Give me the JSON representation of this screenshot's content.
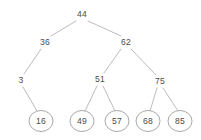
{
  "figure": {
    "width": 201,
    "height": 140,
    "background": "#ffffff",
    "edge_color": "#b4b4b4",
    "node_outline_color": "#9e9e9e",
    "text_color": "#4a4a4a"
  },
  "chart_data": {
    "type": "diagram",
    "diagram_type": "binary-tree",
    "title": "",
    "nodes": [
      {
        "id": "n44",
        "label": "44",
        "x": 82,
        "y": 14,
        "shape": "plain",
        "depth": 0
      },
      {
        "id": "n36",
        "label": "36",
        "x": 45,
        "y": 42,
        "shape": "plain",
        "depth": 1
      },
      {
        "id": "n62",
        "label": "62",
        "x": 126,
        "y": 42,
        "shape": "plain",
        "depth": 1
      },
      {
        "id": "n3",
        "label": "3",
        "x": 21,
        "y": 80,
        "shape": "plain",
        "depth": 2
      },
      {
        "id": "n51",
        "label": "51",
        "x": 100,
        "y": 79,
        "shape": "plain",
        "depth": 2
      },
      {
        "id": "n75",
        "label": "75",
        "x": 160,
        "y": 81,
        "shape": "plain",
        "depth": 2
      },
      {
        "id": "n16",
        "label": "16",
        "x": 41,
        "y": 121,
        "shape": "ellipse",
        "depth": 3
      },
      {
        "id": "n49",
        "label": "49",
        "x": 82,
        "y": 121,
        "shape": "ellipse",
        "depth": 3
      },
      {
        "id": "n57",
        "label": "57",
        "x": 117,
        "y": 121,
        "shape": "ellipse",
        "depth": 3
      },
      {
        "id": "n68",
        "label": "68",
        "x": 148,
        "y": 121,
        "shape": "ellipse",
        "depth": 3
      },
      {
        "id": "n85",
        "label": "85",
        "x": 180,
        "y": 121,
        "shape": "ellipse",
        "depth": 3
      }
    ],
    "edges": [
      {
        "from": "n44",
        "to": "n36",
        "x1": 76,
        "y1": 21,
        "x2": 51,
        "y2": 36
      },
      {
        "from": "n44",
        "to": "n62",
        "x1": 88,
        "y1": 21,
        "x2": 121,
        "y2": 36
      },
      {
        "from": "n36",
        "to": "n3",
        "x1": 41,
        "y1": 49,
        "x2": 24,
        "y2": 74
      },
      {
        "from": "n62",
        "to": "n51",
        "x1": 121,
        "y1": 49,
        "x2": 104,
        "y2": 73
      },
      {
        "from": "n62",
        "to": "n75",
        "x1": 131,
        "y1": 49,
        "x2": 156,
        "y2": 75
      },
      {
        "from": "n3",
        "to": "n16",
        "x1": 23,
        "y1": 87,
        "x2": 37,
        "y2": 111
      },
      {
        "from": "n51",
        "to": "n49",
        "x1": 97,
        "y1": 86,
        "x2": 85,
        "y2": 111
      },
      {
        "from": "n51",
        "to": "n57",
        "x1": 103,
        "y1": 86,
        "x2": 115,
        "y2": 111
      },
      {
        "from": "n75",
        "to": "n68",
        "x1": 157,
        "y1": 88,
        "x2": 150,
        "y2": 111
      },
      {
        "from": "n75",
        "to": "n85",
        "x1": 163,
        "y1": 88,
        "x2": 178,
        "y2": 111
      }
    ],
    "ellipse_rx": 12,
    "ellipse_ry": 10.5
  }
}
